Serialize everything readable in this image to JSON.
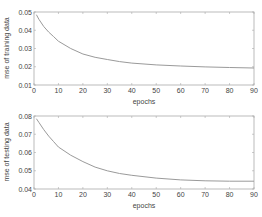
{
  "chart_data": [
    {
      "type": "line",
      "title": "",
      "xlabel": "epochs",
      "ylabel": "mse of training data",
      "xlim": [
        0,
        90
      ],
      "ylim": [
        0.01,
        0.05
      ],
      "xticks": [
        0,
        10,
        20,
        30,
        40,
        50,
        60,
        70,
        80,
        90
      ],
      "yticks": [
        0.01,
        0.02,
        0.03,
        0.04,
        0.05
      ],
      "ytick_labels": [
        "0.01",
        "0.02",
        "0.03",
        "0.04",
        "0.05"
      ],
      "grid": false,
      "legend": null,
      "series": [
        {
          "name": "training mse",
          "color": "#9a9a9a",
          "x": [
            1,
            2,
            4,
            6,
            8,
            10,
            15,
            20,
            25,
            30,
            35,
            40,
            50,
            60,
            70,
            80,
            90
          ],
          "y": [
            0.0485,
            0.046,
            0.042,
            0.039,
            0.0365,
            0.034,
            0.03,
            0.027,
            0.0252,
            0.024,
            0.0228,
            0.022,
            0.021,
            0.0204,
            0.0199,
            0.0196,
            0.0193
          ]
        }
      ]
    },
    {
      "type": "line",
      "title": "",
      "xlabel": "epochs",
      "ylabel": "mse of testing data",
      "xlim": [
        0,
        90
      ],
      "ylim": [
        0.04,
        0.08
      ],
      "xticks": [
        0,
        10,
        20,
        30,
        40,
        50,
        60,
        70,
        80,
        90
      ],
      "yticks": [
        0.04,
        0.05,
        0.06,
        0.07,
        0.08
      ],
      "ytick_labels": [
        "0.04",
        "0.05",
        "0.06",
        "0.07",
        "0.08"
      ],
      "grid": false,
      "legend": null,
      "series": [
        {
          "name": "testing mse",
          "color": "#9a9a9a",
          "x": [
            1,
            2,
            4,
            6,
            8,
            10,
            15,
            20,
            25,
            30,
            35,
            40,
            50,
            60,
            70,
            80,
            90
          ],
          "y": [
            0.0785,
            0.0765,
            0.0725,
            0.069,
            0.066,
            0.063,
            0.0585,
            0.055,
            0.052,
            0.05,
            0.0485,
            0.0475,
            0.046,
            0.045,
            0.0445,
            0.0443,
            0.0443
          ]
        }
      ]
    }
  ],
  "plots": [
    {
      "ylabel": "mse of training data",
      "xlabel": "epochs",
      "xtick_labels": [
        "0",
        "10",
        "20",
        "30",
        "40",
        "50",
        "60",
        "70",
        "80",
        "90"
      ],
      "ytick_labels": [
        "0.01",
        "0.02",
        "0.03",
        "0.04",
        "0.05"
      ]
    },
    {
      "ylabel": "mse of testing data",
      "xlabel": "epochs",
      "xtick_labels": [
        "0",
        "10",
        "20",
        "30",
        "40",
        "50",
        "60",
        "70",
        "80",
        "90"
      ],
      "ytick_labels": [
        "0.04",
        "0.05",
        "0.06",
        "0.07",
        "0.08"
      ]
    }
  ]
}
